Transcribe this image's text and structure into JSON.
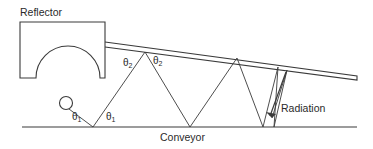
{
  "diagram": {
    "labels": {
      "reflector": "Reflector",
      "conveyor": "Conveyor",
      "radiation": "Radiation"
    },
    "angles": [
      {
        "symbol": "θ",
        "sub": "1"
      },
      {
        "symbol": "θ",
        "sub": "1"
      },
      {
        "symbol": "θ",
        "sub": "2"
      },
      {
        "symbol": "θ",
        "sub": "2"
      }
    ],
    "colors": {
      "line": "#3a3a3a",
      "background": "#ffffff"
    }
  }
}
